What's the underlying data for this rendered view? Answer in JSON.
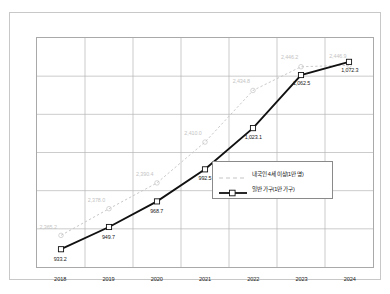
{
  "chart_data": {
    "type": "line",
    "title": "",
    "xlabel": "",
    "ylabel": "",
    "grid": true,
    "legend_position": "inside-center-right",
    "categories": [
      "2018",
      "2019",
      "2020",
      "2021",
      "2022",
      "2023",
      "2024"
    ],
    "series": [
      {
        "name": "내국인 4세 이상(1만 명)",
        "style": "dashed",
        "color": "#c4c4c4",
        "axis": "secondary",
        "ylim": [
          2350,
          2460
        ],
        "values": [
          2365.2,
          2378.0,
          2390.4,
          2410.0,
          2434.8,
          2446.2,
          2446.9
        ],
        "labels": [
          "2,365.2",
          "2,378.0",
          "2,390.4",
          "2,410.0",
          "2,434.8",
          "2,446.2",
          "2,446.9"
        ]
      },
      {
        "name": "일반 가구(1만 가구)",
        "style": "solid-marker",
        "color": "#111111",
        "axis": "primary",
        "ylim": [
          920,
          1090
        ],
        "values": [
          933.2,
          949.7,
          968.7,
          992.5,
          1023.1,
          1062.5,
          1072.3
        ],
        "labels": [
          "933.2",
          "949.7",
          "968.7",
          "992.5",
          "1,023.1",
          "1,062.5",
          "1,072.3"
        ]
      }
    ]
  },
  "legend": {
    "items": [
      {
        "label": "내국인 4세 이상(1만 명)"
      },
      {
        "label": "일반 가구(1만 가구)"
      }
    ]
  }
}
